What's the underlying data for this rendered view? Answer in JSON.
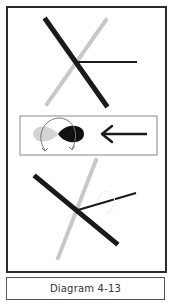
{
  "caption": "Diagram 4-13",
  "colors": {
    "dark_line": "#1a1a1a",
    "light_line": "#c8c8c8",
    "border": "#2a2a2a",
    "light_lobe": "#d4d4d4",
    "dark_lobe": "#111111"
  },
  "panels": [
    {
      "name": "top-crossed-lines",
      "description": "thick dark diagonal, light grey diagonal, thin horizontal line"
    },
    {
      "name": "middle-orbital-rotation",
      "description": "light and dark lobe with curved rotation arrows, left-pointing arrow"
    },
    {
      "name": "bottom-rotated-lines",
      "description": "rotated dark diagonal, light grey diagonal, thin line with faint curve"
    }
  ]
}
